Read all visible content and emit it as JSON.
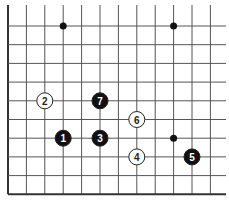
{
  "board": {
    "description": "Go board corner fragment (lower-left, open top and right)",
    "columns": 12,
    "rows": 10,
    "edges": [
      "left",
      "bottom"
    ],
    "star_points": [
      [
        3,
        1
      ],
      [
        9,
        1
      ],
      [
        9,
        7
      ]
    ],
    "stones": [
      {
        "col": 2,
        "row": 5,
        "color": "white",
        "label": "2"
      },
      {
        "col": 5,
        "row": 5,
        "color": "black",
        "label": "7"
      },
      {
        "col": 7,
        "row": 6,
        "color": "white",
        "label": "6"
      },
      {
        "col": 3,
        "row": 7,
        "color": "black",
        "label": "1"
      },
      {
        "col": 5,
        "row": 7,
        "color": "black",
        "label": "3"
      },
      {
        "col": 7,
        "row": 8,
        "color": "white",
        "label": "4"
      },
      {
        "col": 10,
        "row": 8,
        "color": "black",
        "label": "5"
      }
    ],
    "colors": {
      "line": "#555555",
      "edge": "#333333",
      "black": "#111111",
      "white": "#ffffff"
    }
  }
}
